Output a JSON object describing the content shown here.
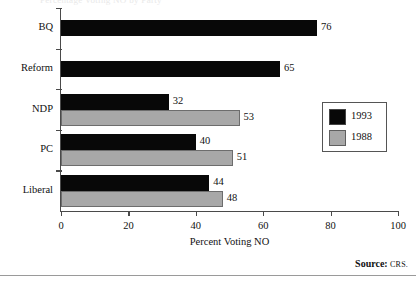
{
  "chart_data": {
    "type": "bar",
    "orientation": "horizontal",
    "title": "",
    "xlabel": "Percent Voting NO",
    "ylabel": "",
    "xlim": [
      0,
      100
    ],
    "xticks": [
      0,
      20,
      40,
      60,
      80,
      100
    ],
    "grid": false,
    "legend_position": "right",
    "categories": [
      "BQ",
      "Reform",
      "NDP",
      "PC",
      "Liberal"
    ],
    "series": [
      {
        "name": "1993",
        "color": "#080808",
        "values": [
          76,
          65,
          32,
          40,
          44
        ]
      },
      {
        "name": "1988",
        "color": "#a8a8a8",
        "values": [
          null,
          null,
          53,
          51,
          48
        ]
      }
    ],
    "points": [
      {
        "category": "BQ",
        "series": "1993",
        "value": 76,
        "label": "76"
      },
      {
        "category": "Reform",
        "series": "1993",
        "value": 65,
        "label": "65"
      },
      {
        "category": "NDP",
        "series": "1993",
        "value": 32,
        "label": "32"
      },
      {
        "category": "NDP",
        "series": "1988",
        "value": 53,
        "label": "53"
      },
      {
        "category": "PC",
        "series": "1993",
        "value": 40,
        "label": "40"
      },
      {
        "category": "PC",
        "series": "1988",
        "value": 51,
        "label": "51"
      },
      {
        "category": "Liberal",
        "series": "1993",
        "value": 44,
        "label": "44"
      },
      {
        "category": "Liberal",
        "series": "1988",
        "value": 48,
        "label": "48"
      }
    ]
  },
  "axis": {
    "tick_labels": [
      "0",
      "20",
      "40",
      "60",
      "80",
      "100"
    ],
    "x_title": "Percent Voting NO"
  },
  "legend": {
    "entries": [
      {
        "label": "1993",
        "swatch": "black-swatch"
      },
      {
        "label": "1988",
        "swatch": "gray-swatch"
      }
    ]
  },
  "footer": {
    "source_label": "Source:",
    "source_value": "CRS."
  },
  "title_remnant": "Percentage Voting NO by Party"
}
